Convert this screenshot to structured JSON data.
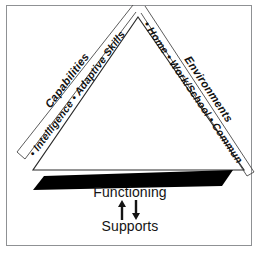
{
  "figure": {
    "background_color": "#ffffff",
    "frame_color": "#8f9194",
    "base_bar_color": "#000000",
    "line_color": "#2a2a2a"
  },
  "triangle": {
    "left_side": {
      "outer_label": "Capabilities",
      "inner_label": "• Intelligence • Adaptive Skills"
    },
    "right_side": {
      "outer_label": "Environments",
      "inner_label": "• Home • Work/School • Community"
    }
  },
  "base": {
    "functioning_label": "Functioning",
    "supports_label": "Supports",
    "arrow_icon": "up-down-arrow-icon"
  }
}
